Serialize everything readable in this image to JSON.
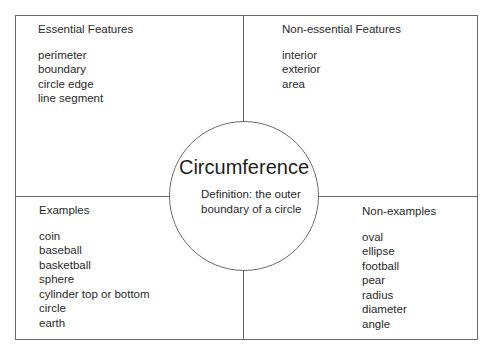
{
  "diagram": {
    "type": "frayer-model",
    "center": {
      "term": "Circumference",
      "definition": "Definition: the outer boundary of a circle"
    },
    "quadrants": {
      "essential": {
        "heading": "Essential Features",
        "items": [
          "perimeter",
          "boundary",
          "circle edge",
          "line segment"
        ]
      },
      "non_essential": {
        "heading": "Non-essential Features",
        "items": [
          "interior",
          "exterior",
          "area"
        ]
      },
      "examples": {
        "heading": "Examples",
        "items": [
          "coin",
          "baseball",
          "basketball",
          "sphere",
          "cylinder top or bottom",
          "circle",
          "earth"
        ]
      },
      "non_examples": {
        "heading": "Non-examples",
        "items": [
          "oval",
          "ellipse",
          "football",
          "pear",
          "radius",
          "diameter",
          "angle"
        ]
      }
    }
  }
}
